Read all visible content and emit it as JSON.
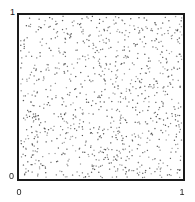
{
  "figure": {
    "title": "",
    "background_color": "#ffffff",
    "width": 195,
    "height": 202
  },
  "axes": {
    "frame_color": "#1a1a1a",
    "frame_width_px": 2,
    "x_ticks": [
      "0",
      "1"
    ],
    "y_ticks": [
      "0",
      "1"
    ],
    "x_tick_left_label": "0",
    "x_tick_right_label": "1",
    "y_tick_bottom_label": "0",
    "y_tick_top_label": "1"
  },
  "chart_data": {
    "type": "scatter",
    "title": "",
    "subtitle": "",
    "xlabel": "",
    "ylabel": "",
    "xlim": [
      0,
      1
    ],
    "ylim": [
      0,
      1
    ],
    "xticks": [
      0,
      1
    ],
    "yticks": [
      0,
      1
    ],
    "xticklabels": [
      "0",
      "1"
    ],
    "yticklabels": [
      "0",
      "1"
    ],
    "grid": false,
    "legend": null,
    "legend_position": "none",
    "annotations": [],
    "n_points": 1000,
    "marker": {
      "shape": "dot",
      "size_px": 1.4,
      "color": "#555555",
      "alpha": 0.85
    },
    "distribution": "uniform-random",
    "series": [
      {
        "name": "uniform random points",
        "color": "#555555",
        "n": 1000,
        "seed": 20240517,
        "x": [],
        "y": []
      }
    ]
  }
}
